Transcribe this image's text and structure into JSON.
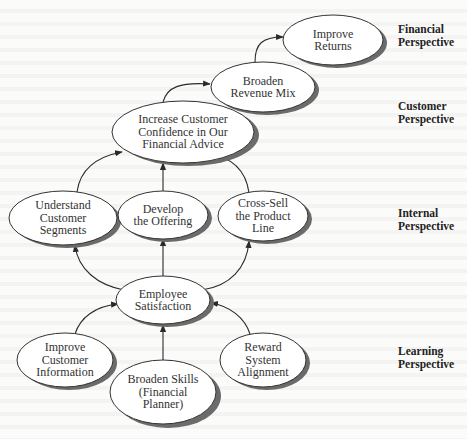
{
  "diagram": {
    "type": "strategy-map",
    "perspectives": [
      {
        "id": "financial",
        "label": "Financial\nPerspective"
      },
      {
        "id": "customer",
        "label": "Customer\nPerspective"
      },
      {
        "id": "internal",
        "label": "Internal\nPerspective"
      },
      {
        "id": "learning",
        "label": "Learning\nPerspective"
      }
    ],
    "nodes": {
      "improve_returns": {
        "label": "Improve\nReturns",
        "perspective": "financial"
      },
      "broaden_revenue_mix": {
        "label": "Broaden\nRevenue Mix",
        "perspective": "customer"
      },
      "increase_confidence": {
        "label": "Increase Customer\nConfidence in Our\nFinancial Advice",
        "perspective": "customer"
      },
      "understand_segments": {
        "label": "Understand\nCustomer\nSegments",
        "perspective": "internal"
      },
      "develop_offering": {
        "label": "Develop\nthe Offering",
        "perspective": "internal"
      },
      "cross_sell": {
        "label": "Cross-Sell\nthe Product\nLine",
        "perspective": "internal"
      },
      "employee_satisfaction": {
        "label": "Employee\nSatisfaction",
        "perspective": "learning"
      },
      "improve_customer_info": {
        "label": "Improve\nCustomer\nInformation",
        "perspective": "learning"
      },
      "broaden_skills": {
        "label": "Broaden Skills\n(Financial\nPlanner)",
        "perspective": "learning"
      },
      "reward_alignment": {
        "label": "Reward\nSystem\nAlignment",
        "perspective": "learning"
      }
    },
    "edges": [
      {
        "from": "broaden_revenue_mix",
        "to": "improve_returns"
      },
      {
        "from": "increase_confidence",
        "to": "broaden_revenue_mix"
      },
      {
        "from": "understand_segments",
        "to": "increase_confidence"
      },
      {
        "from": "develop_offering",
        "to": "increase_confidence"
      },
      {
        "from": "cross_sell",
        "to": "increase_confidence"
      },
      {
        "from": "employee_satisfaction",
        "to": "understand_segments"
      },
      {
        "from": "employee_satisfaction",
        "to": "develop_offering"
      },
      {
        "from": "employee_satisfaction",
        "to": "cross_sell"
      },
      {
        "from": "improve_customer_info",
        "to": "employee_satisfaction"
      },
      {
        "from": "broaden_skills",
        "to": "employee_satisfaction"
      },
      {
        "from": "reward_alignment",
        "to": "employee_satisfaction"
      }
    ],
    "colors": {
      "node_fill": "#ffffff",
      "node_stroke": "#333333",
      "shadow": "#6b6b6b",
      "arrow": "#2a2a2a"
    }
  }
}
